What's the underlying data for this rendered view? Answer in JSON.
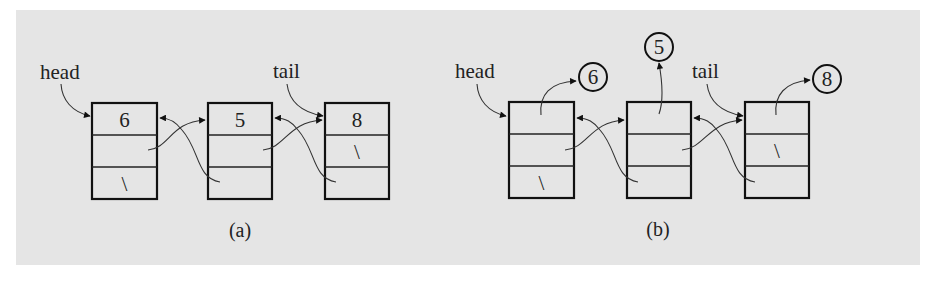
{
  "figure": {
    "background_color": "#e5e5e5",
    "panels": [
      {
        "caption": "(a)",
        "labels": {
          "head": "head",
          "tail": "tail"
        },
        "nodes": [
          {
            "element": "6",
            "next": "",
            "prev": "\\"
          },
          {
            "element": "5",
            "next": "",
            "prev": ""
          },
          {
            "element": "8",
            "next": "\\",
            "prev": ""
          }
        ]
      },
      {
        "caption": "(b)",
        "labels": {
          "head": "head",
          "tail": "tail"
        },
        "nodes": [
          {
            "element": "",
            "next": "",
            "prev": "\\",
            "object": "6"
          },
          {
            "element": "",
            "next": "",
            "prev": "",
            "object": "5"
          },
          {
            "element": "",
            "next": "\\",
            "prev": "",
            "object": "8"
          }
        ]
      }
    ]
  }
}
